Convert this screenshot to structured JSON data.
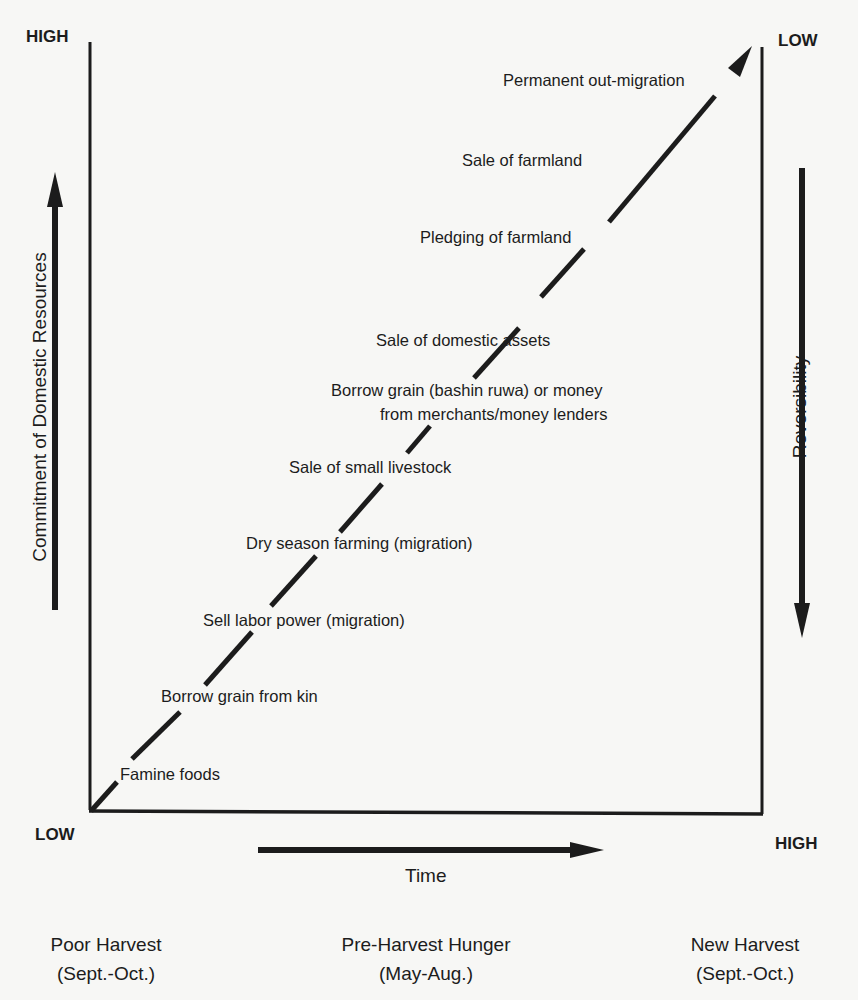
{
  "corners": {
    "top_left": "HIGH",
    "top_right": "LOW",
    "bottom_left": "LOW",
    "bottom_right": "HIGH"
  },
  "axes": {
    "left": "Commitment of Domestic Resources",
    "right": "Reversibility",
    "bottom": "Time"
  },
  "stages": [
    {
      "label": "Famine foods"
    },
    {
      "label": "Borrow grain from kin"
    },
    {
      "label": "Sell labor power (migration)"
    },
    {
      "label": "Dry season farming (migration)"
    },
    {
      "label": "Sale of small livestock"
    },
    {
      "label_line1": "Borrow grain (bashin ruwa) or money",
      "label_line2": "from merchants/money lenders"
    },
    {
      "label": "Sale of domestic assets"
    },
    {
      "label": "Pledging of farmland"
    },
    {
      "label": "Sale of farmland"
    },
    {
      "label": "Permanent out-migration"
    }
  ],
  "periods": [
    {
      "name": "Poor Harvest",
      "months": "(Sept.-Oct.)"
    },
    {
      "name": "Pre-Harvest Hunger",
      "months": "(May-Aug.)"
    },
    {
      "name": "New Harvest",
      "months": "(Sept.-Oct.)"
    }
  ],
  "colors": {
    "ink": "#1c1c1c",
    "paper": "#f7f7f5"
  }
}
